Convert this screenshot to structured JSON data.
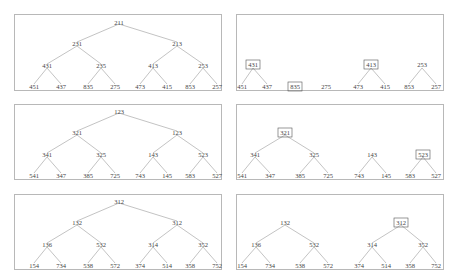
{
  "panels": [
    {
      "id": "left-1",
      "type": "full-tree",
      "root": "211",
      "level1": [
        "231",
        "213"
      ],
      "level2": [
        "431",
        "235",
        "413",
        "253"
      ],
      "leaves": [
        "451",
        "437",
        "835",
        "275",
        "473",
        "415",
        "853",
        "257"
      ]
    },
    {
      "id": "right-1",
      "type": "forest",
      "boxed": [
        "431",
        "835",
        "413"
      ],
      "level2": [
        "431",
        "",
        "413",
        "253"
      ],
      "leaves": [
        "451",
        "437",
        "835",
        "275",
        "473",
        "415",
        "853",
        "257"
      ]
    },
    {
      "id": "left-2",
      "type": "full-tree",
      "root": "123",
      "level1": [
        "321",
        "123"
      ],
      "level2": [
        "341",
        "325",
        "143",
        "523"
      ],
      "leaves": [
        "541",
        "347",
        "385",
        "725",
        "743",
        "145",
        "583",
        "527"
      ]
    },
    {
      "id": "right-2",
      "type": "forest",
      "boxed": [
        "321",
        "523"
      ],
      "level1": [
        "321",
        ""
      ],
      "level2": [
        "341",
        "325",
        "143",
        "523"
      ],
      "leaves": [
        "541",
        "347",
        "385",
        "725",
        "743",
        "145",
        "583",
        "527"
      ]
    },
    {
      "id": "left-3",
      "type": "full-tree",
      "root": "312",
      "level1": [
        "132",
        "312"
      ],
      "level2": [
        "136",
        "532",
        "314",
        "352"
      ],
      "leaves": [
        "154",
        "734",
        "538",
        "572",
        "374",
        "514",
        "358",
        "752"
      ]
    },
    {
      "id": "right-3",
      "type": "forest",
      "boxed": [
        "312"
      ],
      "level1": [
        "132",
        "312"
      ],
      "level2": [
        "136",
        "532",
        "314",
        "352"
      ],
      "leaves": [
        "154",
        "734",
        "538",
        "572",
        "374",
        "514",
        "358",
        "752"
      ]
    }
  ],
  "colors": {
    "border": "#b8b8b8",
    "edge": "#9a9a9a",
    "text": "#444444"
  }
}
